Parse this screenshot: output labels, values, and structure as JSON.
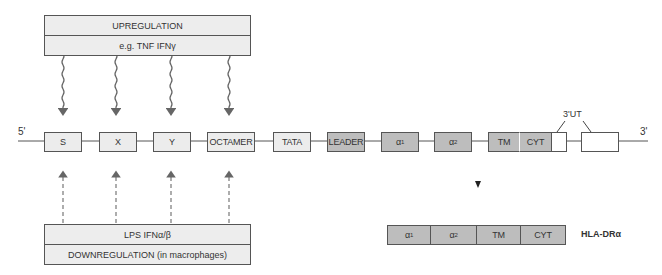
{
  "upregulation": {
    "title": "UPREGULATION",
    "factors": "e.g. TNF  IFNγ"
  },
  "downregulation": {
    "factors": "LPS  IFNα/β",
    "title": "DOWNREGULATION (in macrophages)"
  },
  "gene": {
    "five_prime": "5'",
    "three_prime": "3'",
    "utr_label": "3'UT",
    "elements": [
      {
        "label": "S",
        "type": "promoter"
      },
      {
        "label": "X",
        "type": "promoter"
      },
      {
        "label": "Y",
        "type": "promoter"
      },
      {
        "label": "OCTAMER",
        "type": "promoter"
      },
      {
        "label": "TATA",
        "type": "promoter"
      },
      {
        "label": "LEADER",
        "type": "exon"
      },
      {
        "label": "α",
        "sub": "1",
        "type": "exon"
      },
      {
        "label": "α",
        "sub": "2",
        "type": "exon"
      },
      {
        "label": "TM",
        "type": "exon"
      },
      {
        "label": "CYT",
        "type": "exon"
      }
    ]
  },
  "protein": {
    "name": "HLA-DRα",
    "segments": [
      {
        "label": "α",
        "sub": "1"
      },
      {
        "label": "α",
        "sub": "2"
      },
      {
        "label": "TM"
      },
      {
        "label": "CYT"
      }
    ]
  },
  "colors": {
    "light": "#ececec",
    "dark": "#bdbdbd",
    "line": "#555555",
    "arrow": "#666666"
  }
}
